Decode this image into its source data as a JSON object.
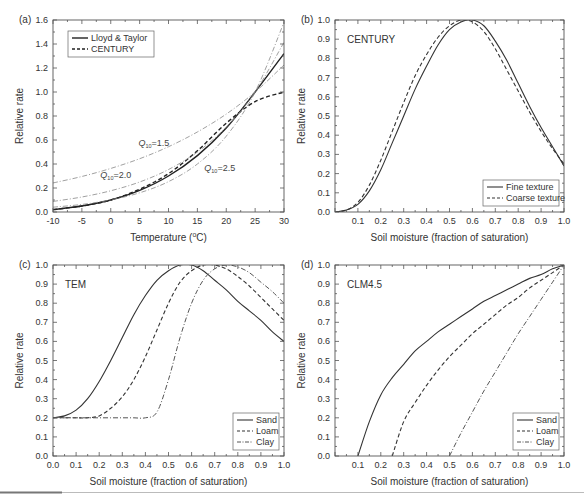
{
  "figure": {
    "bottom_rule": {
      "color": "#bbbbbb",
      "accent_color": "#777777"
    }
  },
  "chart_data": [
    {
      "id": "a",
      "type": "line",
      "panel_label": "(a)",
      "title": "",
      "xlabel": "Temperature (°C)",
      "xlabel_parts": [
        "Temperature (",
        "o",
        "C)"
      ],
      "ylabel": "Relative rate",
      "xlim": [
        -10,
        30
      ],
      "ylim": [
        0,
        1.6
      ],
      "xticks": [
        -10,
        -5,
        0,
        5,
        10,
        15,
        20,
        25,
        30
      ],
      "yticks": [
        0.0,
        0.2,
        0.4,
        0.6,
        0.8,
        1.0,
        1.2,
        1.4,
        1.6
      ],
      "ytick_labels": [
        "0.0",
        "0.2",
        "0.4",
        "0.6",
        "0.8",
        "1.0",
        "1.2",
        "1.4",
        "1.6"
      ],
      "grid": false,
      "legend": {
        "position": "upper-left",
        "entries": [
          "Lloyd & Taylor",
          "CENTURY"
        ]
      },
      "x": [
        -10,
        -5,
        0,
        5,
        10,
        15,
        20,
        25,
        30
      ],
      "series": [
        {
          "name": "Lloyd & Taylor",
          "style": "solid",
          "width": 1.4,
          "color": "#222222",
          "values": [
            0.02,
            0.05,
            0.1,
            0.18,
            0.3,
            0.47,
            0.7,
            1.0,
            1.32
          ]
        },
        {
          "name": "CENTURY",
          "style": "dashed",
          "width": 1.4,
          "color": "#222222",
          "values": [
            0.02,
            0.05,
            0.1,
            0.19,
            0.32,
            0.51,
            0.74,
            0.92,
            1.0
          ]
        },
        {
          "name": "Q10=1.5",
          "style": "dashdot",
          "width": 0.8,
          "color": "#888888",
          "values": [
            0.242,
            0.296,
            0.363,
            0.444,
            0.544,
            0.667,
            0.816,
            1.0,
            1.225
          ]
        },
        {
          "name": "Q10=2.0",
          "style": "dashdot",
          "width": 0.8,
          "color": "#888888",
          "values": [
            0.088,
            0.125,
            0.177,
            0.25,
            0.354,
            0.5,
            0.707,
            1.0,
            1.414
          ]
        },
        {
          "name": "Q10=2.5",
          "style": "dashdot",
          "width": 0.8,
          "color": "#888888",
          "values": [
            0.04,
            0.063,
            0.101,
            0.16,
            0.253,
            0.4,
            0.632,
            1.0,
            1.581
          ]
        }
      ],
      "annotations": [
        {
          "text": "Q",
          "sub": "10",
          "rest": "=1.5",
          "x": 4.8,
          "y": 0.55
        },
        {
          "text": "Q",
          "sub": "10",
          "rest": "=2.0",
          "x": -1.8,
          "y": 0.28
        },
        {
          "text": "Q",
          "sub": "10",
          "rest": "=2.5",
          "x": 16.2,
          "y": 0.34
        }
      ]
    },
    {
      "id": "b",
      "type": "line",
      "panel_label": "(b)",
      "title": "CENTURY",
      "xlabel": "Soil moisture (fraction of saturation)",
      "ylabel": "Relative rate",
      "xlim": [
        0,
        1.0
      ],
      "ylim": [
        0,
        1.0
      ],
      "xticks": [
        0.1,
        0.2,
        0.3,
        0.4,
        0.5,
        0.6,
        0.7,
        0.8,
        0.9,
        1.0
      ],
      "xtick_labels": [
        "0.1",
        "0.2",
        "0.3",
        "0.4",
        "0.5",
        "0.6",
        "0.7",
        "0.8",
        "0.9",
        "1.0"
      ],
      "yticks": [
        0.0,
        0.1,
        0.2,
        0.3,
        0.4,
        0.5,
        0.6,
        0.7,
        0.8,
        0.9,
        1.0
      ],
      "ytick_labels": [
        "0.0",
        "0.1",
        "0.2",
        "0.3",
        "0.4",
        "0.5",
        "0.6",
        "0.7",
        "0.8",
        "0.9",
        "1.0"
      ],
      "grid": false,
      "legend": {
        "position": "lower-right",
        "entries": [
          "Fine texture",
          "Coarse texture"
        ]
      },
      "x": [
        0.0,
        0.05,
        0.1,
        0.15,
        0.2,
        0.25,
        0.3,
        0.35,
        0.4,
        0.45,
        0.5,
        0.55,
        0.6,
        0.65,
        0.7,
        0.75,
        0.8,
        0.85,
        0.9,
        0.95,
        1.0
      ],
      "series": [
        {
          "name": "Fine texture",
          "style": "solid",
          "width": 1.1,
          "color": "#333333",
          "values": [
            0.0,
            0.01,
            0.04,
            0.11,
            0.22,
            0.36,
            0.5,
            0.64,
            0.76,
            0.87,
            0.95,
            0.99,
            1.0,
            0.97,
            0.89,
            0.79,
            0.67,
            0.55,
            0.44,
            0.34,
            0.24
          ]
        },
        {
          "name": "Coarse texture",
          "style": "dashed",
          "width": 1.1,
          "color": "#333333",
          "values": [
            0.0,
            0.01,
            0.05,
            0.14,
            0.27,
            0.42,
            0.57,
            0.71,
            0.82,
            0.91,
            0.97,
            1.0,
            0.99,
            0.94,
            0.85,
            0.74,
            0.63,
            0.52,
            0.42,
            0.33,
            0.25
          ]
        }
      ]
    },
    {
      "id": "c",
      "type": "line",
      "panel_label": "(c)",
      "title": "TEM",
      "xlabel": "Soil moisture (fraction of saturation)",
      "ylabel": "Relative rate",
      "xlim": [
        0,
        1.0
      ],
      "ylim": [
        0,
        1.0
      ],
      "xticks": [
        0.0,
        0.1,
        0.2,
        0.3,
        0.4,
        0.5,
        0.6,
        0.7,
        0.8,
        0.9,
        1.0
      ],
      "xtick_labels": [
        "0.0",
        "0.1",
        "0.2",
        "0.3",
        "0.4",
        "0.5",
        "0.6",
        "0.7",
        "0.8",
        "0.9",
        "1.0"
      ],
      "yticks": [
        0.0,
        0.1,
        0.2,
        0.3,
        0.4,
        0.5,
        0.6,
        0.7,
        0.8,
        0.9,
        1.0
      ],
      "ytick_labels": [
        "0.0",
        "0.1",
        "0.2",
        "0.3",
        "0.4",
        "0.5",
        "0.6",
        "0.7",
        "0.8",
        "0.9",
        "1.0"
      ],
      "grid": false,
      "legend": {
        "position": "lower-right",
        "entries": [
          "Sand",
          "Loam",
          "Clay"
        ]
      },
      "x": [
        0.0,
        0.05,
        0.1,
        0.15,
        0.2,
        0.25,
        0.3,
        0.35,
        0.4,
        0.45,
        0.5,
        0.55,
        0.6,
        0.65,
        0.7,
        0.75,
        0.8,
        0.85,
        0.9,
        0.95,
        1.0
      ],
      "series": [
        {
          "name": "Sand",
          "style": "solid",
          "width": 1.1,
          "color": "#333333",
          "values": [
            0.2,
            0.21,
            0.24,
            0.3,
            0.39,
            0.5,
            0.62,
            0.74,
            0.84,
            0.92,
            0.97,
            1.0,
            1.0,
            0.97,
            0.92,
            0.87,
            0.81,
            0.76,
            0.71,
            0.65,
            0.6
          ]
        },
        {
          "name": "Loam",
          "style": "dashed",
          "width": 1.1,
          "color": "#333333",
          "values": [
            0.2,
            0.2,
            0.2,
            0.2,
            0.21,
            0.25,
            0.31,
            0.4,
            0.52,
            0.66,
            0.8,
            0.91,
            0.97,
            1.0,
            1.0,
            0.98,
            0.94,
            0.89,
            0.83,
            0.77,
            0.71
          ]
        },
        {
          "name": "Clay",
          "style": "dashdot",
          "width": 1.0,
          "color": "#555555",
          "values": [
            0.2,
            0.2,
            0.2,
            0.2,
            0.2,
            0.2,
            0.2,
            0.2,
            0.2,
            0.23,
            0.4,
            0.62,
            0.8,
            0.92,
            0.98,
            1.0,
            0.99,
            0.96,
            0.91,
            0.86,
            0.8
          ]
        }
      ]
    },
    {
      "id": "d",
      "type": "line",
      "panel_label": "(d)",
      "title": "CLM4.5",
      "xlabel": "Soil moisture (fraction of saturation)",
      "ylabel": "Relative rate",
      "xlim": [
        0,
        1.0
      ],
      "ylim": [
        0,
        1.0
      ],
      "xticks": [
        0.1,
        0.2,
        0.3,
        0.4,
        0.5,
        0.6,
        0.7,
        0.8,
        0.9,
        1.0
      ],
      "xtick_labels": [
        "0.1",
        "0.2",
        "0.3",
        "0.4",
        "0.5",
        "0.6",
        "0.7",
        "0.8",
        "0.9",
        "1.0"
      ],
      "yticks": [
        0.0,
        0.1,
        0.2,
        0.3,
        0.4,
        0.5,
        0.6,
        0.7,
        0.8,
        0.9,
        1.0
      ],
      "ytick_labels": [
        "0.0",
        "0.1",
        "0.2",
        "0.3",
        "0.4",
        "0.5",
        "0.6",
        "0.7",
        "0.8",
        "0.9",
        "1.0"
      ],
      "grid": false,
      "legend": {
        "position": "lower-right",
        "entries": [
          "Sand",
          "Loam",
          "Clay"
        ]
      },
      "x": [
        0.0,
        0.05,
        0.1,
        0.15,
        0.2,
        0.25,
        0.3,
        0.35,
        0.4,
        0.45,
        0.5,
        0.55,
        0.6,
        0.65,
        0.7,
        0.75,
        0.8,
        0.85,
        0.9,
        0.95,
        1.0
      ],
      "series": [
        {
          "name": "Sand",
          "style": "solid",
          "width": 1.1,
          "color": "#333333",
          "values": [
            null,
            null,
            0.0,
            0.18,
            0.32,
            0.41,
            0.48,
            0.55,
            0.6,
            0.65,
            0.69,
            0.73,
            0.77,
            0.81,
            0.84,
            0.87,
            0.9,
            0.93,
            0.95,
            0.98,
            1.0
          ]
        },
        {
          "name": "Loam",
          "style": "dashed",
          "width": 1.1,
          "color": "#333333",
          "values": [
            null,
            null,
            null,
            null,
            null,
            0.0,
            0.18,
            0.28,
            0.37,
            0.45,
            0.52,
            0.58,
            0.64,
            0.69,
            0.74,
            0.79,
            0.83,
            0.88,
            0.92,
            0.96,
            1.0
          ]
        },
        {
          "name": "Clay",
          "style": "dashdot",
          "width": 1.0,
          "color": "#555555",
          "values": [
            null,
            null,
            null,
            null,
            null,
            null,
            null,
            null,
            null,
            null,
            0.0,
            0.12,
            0.23,
            0.34,
            0.44,
            0.54,
            0.64,
            0.73,
            0.82,
            0.91,
            1.0
          ]
        }
      ]
    }
  ]
}
